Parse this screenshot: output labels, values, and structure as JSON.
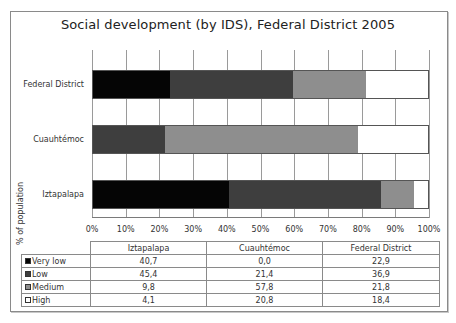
{
  "chart_data": {
    "type": "bar",
    "orientation": "horizontal",
    "stacked": true,
    "normalized_percent": true,
    "title": "Social development (by IDS), Federal District 2005",
    "xlabel": "",
    "ylabel": "% of population",
    "xlim": [
      0,
      100
    ],
    "x_ticks": [
      "0%",
      "10%",
      "20%",
      "30%",
      "40%",
      "50%",
      "60%",
      "70%",
      "80%",
      "90%",
      "100%"
    ],
    "grid": true,
    "categories": [
      "Iztapalapa",
      "Cuauhtémoc",
      "Federal District"
    ],
    "categories_top_to_bottom": [
      "Federal District",
      "Cuauhtémoc",
      "Iztapalapa"
    ],
    "series": [
      {
        "name": "Very low",
        "key": "very_low",
        "color": "#050505",
        "values": [
          40.7,
          0.0,
          22.9
        ]
      },
      {
        "name": "Low",
        "key": "low",
        "color": "#3e3e3e",
        "values": [
          45.4,
          21.4,
          36.9
        ]
      },
      {
        "name": "Medium",
        "key": "medium",
        "color": "#8e8e8e",
        "values": [
          9.8,
          57.8,
          21.8
        ]
      },
      {
        "name": "High",
        "key": "high",
        "color": "#ffffff",
        "values": [
          4.1,
          20.8,
          18.4
        ]
      }
    ],
    "legend_position": "data table below chart"
  },
  "table": {
    "headers": [
      "Iztapalapa",
      "Cuauhtémoc",
      "Federal District"
    ],
    "rows": [
      {
        "label": "Very low",
        "swatch": "#050505",
        "values": [
          "40,7",
          "0,0",
          "22,9"
        ]
      },
      {
        "label": "Low",
        "swatch": "#3e3e3e",
        "values": [
          "45,4",
          "21,4",
          "36,9"
        ]
      },
      {
        "label": "Medium",
        "swatch": "#8e8e8e",
        "values": [
          "9,8",
          "57,8",
          "21,8"
        ]
      },
      {
        "label": "High",
        "swatch": "#ffffff",
        "values": [
          "4,1",
          "20,8",
          "18,4"
        ]
      }
    ]
  }
}
